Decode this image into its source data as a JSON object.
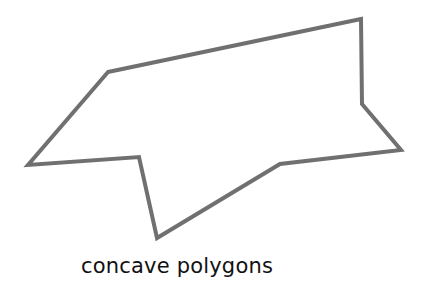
{
  "figure": {
    "stroke_color": "#707070",
    "fill_color": "#ffffff",
    "stroke_width": 4,
    "polygon_points": "108,72 361,19 362,104 401,150 280,164 157,238 139,157 28,165"
  },
  "caption": "concave polygons"
}
